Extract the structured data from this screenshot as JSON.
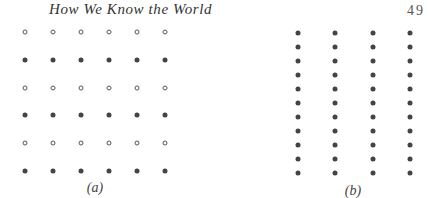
{
  "header": {
    "title": "How We Know the World",
    "page_number": "49"
  },
  "figures": [
    {
      "id": "a",
      "caption": "(a)",
      "columns": 6,
      "rows": 6,
      "row_styles": [
        "hollow",
        "filled",
        "hollow",
        "filled",
        "hollow",
        "filled"
      ],
      "col_x": [
        25,
        53,
        81,
        109,
        137,
        165
      ],
      "row_y": [
        32,
        60,
        88,
        115,
        143,
        171
      ],
      "caption_x": 95,
      "caption_y": 180
    },
    {
      "id": "b",
      "caption": "(b)",
      "columns": 4,
      "rows": 11,
      "row_styles": [
        "filled",
        "filled",
        "filled",
        "filled",
        "filled",
        "filled",
        "filled",
        "filled",
        "filled",
        "filled",
        "filled"
      ],
      "col_x": [
        298,
        335,
        373,
        410
      ],
      "row_y": [
        33,
        47,
        61,
        75,
        89,
        103,
        117,
        131,
        145,
        159,
        173
      ],
      "caption_x": 353,
      "caption_y": 183
    }
  ],
  "colors": {
    "dot_fill": "#444444",
    "dot_outline": "#555555",
    "text": "#333333"
  }
}
